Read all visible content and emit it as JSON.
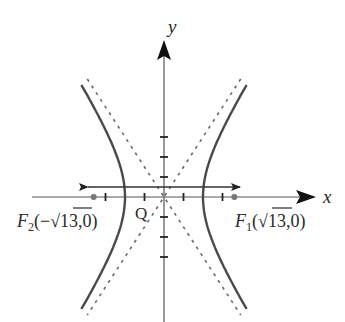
{
  "diagram": {
    "type": "hyperbola",
    "equation": "x^2/4 - y^2/9 = 1",
    "a": 2,
    "b": 3,
    "c_label": "√13",
    "colors": {
      "axis": "#555555",
      "curve": "#4a4a4a",
      "asymptote": "#6a6a6a",
      "focus_point": "#777777",
      "arrow_line": "#333333",
      "text": "#2a2a2a"
    },
    "axes": {
      "x_label": "x",
      "y_label": "y",
      "origin_label": "Q",
      "x_ticks": [
        -3,
        -2,
        -1,
        1,
        2,
        3
      ],
      "y_ticks": [
        -3,
        -2,
        -1,
        1,
        2,
        3
      ]
    },
    "foci": [
      {
        "name": "F",
        "sub": "1",
        "coord_open": "(",
        "sqrt": "13",
        "coord_close": ",0)",
        "sign": ""
      },
      {
        "name": "F",
        "sub": "2",
        "coord_open": "(−",
        "sqrt": "13",
        "coord_close": ",0)",
        "sign": "−"
      }
    ],
    "asymptotes": [
      "y = 3x/2",
      "y = -3x/2"
    ],
    "double_arrow_line": {
      "y": 0.5,
      "x_from": -3.9,
      "x_to": 3.9
    }
  }
}
